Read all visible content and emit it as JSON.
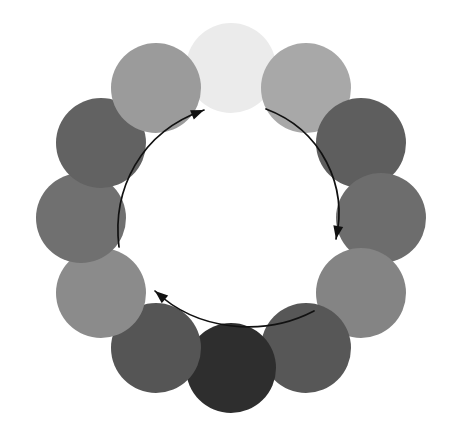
{
  "diagram": {
    "canvas": {
      "width": 469,
      "height": 435,
      "background": "#ffffff"
    },
    "ring": {
      "center_x": 231,
      "center_y": 218,
      "radius": 150,
      "node_count": 12,
      "node_radius": 45
    },
    "nodes": [
      {
        "position_label": "12 o'clock",
        "angle_deg": 0,
        "cx": 231,
        "cy": 68,
        "r": 45,
        "color": "#ebebeb",
        "gray_level": 235
      },
      {
        "position_label": "1 o'clock",
        "angle_deg": 30,
        "cx": 306,
        "cy": 88,
        "r": 45,
        "color": "#a8a8a8",
        "gray_level": 168
      },
      {
        "position_label": "2 o'clock",
        "angle_deg": 60,
        "cx": 361,
        "cy": 143,
        "r": 45,
        "color": "#5e5e5e",
        "gray_level": 94
      },
      {
        "position_label": "3 o'clock",
        "angle_deg": 90,
        "cx": 381,
        "cy": 218,
        "r": 45,
        "color": "#6d6d6d",
        "gray_level": 109
      },
      {
        "position_label": "4 o'clock",
        "angle_deg": 120,
        "cx": 361,
        "cy": 293,
        "r": 45,
        "color": "#848484",
        "gray_level": 132
      },
      {
        "position_label": "5 o'clock",
        "angle_deg": 150,
        "cx": 306,
        "cy": 348,
        "r": 45,
        "color": "#575757",
        "gray_level": 87
      },
      {
        "position_label": "6 o'clock",
        "angle_deg": 180,
        "cx": 231,
        "cy": 368,
        "r": 45,
        "color": "#2e2e2e",
        "gray_level": 46
      },
      {
        "position_label": "7 o'clock",
        "angle_deg": 210,
        "cx": 156,
        "cy": 348,
        "r": 45,
        "color": "#555555",
        "gray_level": 85
      },
      {
        "position_label": "8 o'clock",
        "angle_deg": 240,
        "cx": 101,
        "cy": 293,
        "r": 45,
        "color": "#8b8b8b",
        "gray_level": 139
      },
      {
        "position_label": "9 o'clock",
        "angle_deg": 270,
        "cx": 81,
        "cy": 218,
        "r": 45,
        "color": "#707070",
        "gray_level": 112
      },
      {
        "position_label": "10 o'clock",
        "angle_deg": 300,
        "cx": 101,
        "cy": 143,
        "r": 45,
        "color": "#626262",
        "gray_level": 98
      },
      {
        "position_label": "11 o'clock",
        "angle_deg": 330,
        "cx": 156,
        "cy": 88,
        "r": 45,
        "color": "#9b9b9b",
        "gray_level": 155
      }
    ],
    "arrows": {
      "stroke_color": "#111111",
      "stroke_width": 1.7,
      "items": [
        {
          "name": "left-ascending-arrow",
          "direction": "clockwise-upward",
          "path": "M 119 247 C 112 190 140 132 204 110",
          "head_points": "204,110 194,116 198,104",
          "head_rotation_deg": -22
        },
        {
          "name": "right-descending-arrow",
          "direction": "clockwise-downward",
          "path": "M 266 109 C 322 130 348 186 336 239",
          "head_points": "336,239 329,228 342,230",
          "head_rotation_deg": 100
        },
        {
          "name": "bottom-leftward-arrow",
          "direction": "clockwise-leftward",
          "path": "M 314 311 C 262 338 196 330 155 291",
          "head_points": "155,291 166,293 161,282",
          "head_rotation_deg": 220
        }
      ]
    }
  }
}
